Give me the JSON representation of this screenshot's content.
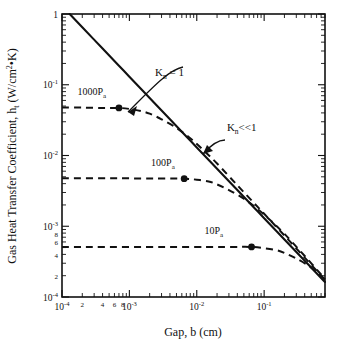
{
  "chart_data": {
    "type": "line",
    "title": "",
    "xlabel": "Gap, b (cm)",
    "ylabel": "Gas Heat Transfer Coefficient, h",
    "ylabel_sub": "t",
    "ylabel_units": " (W/cm",
    "ylabel_units_exp": "2",
    "ylabel_units_tail": "•K)",
    "xscale": "log",
    "yscale": "log",
    "xlim": [
      0.0001,
      0.8
    ],
    "ylim": [
      0.0001,
      1
    ],
    "grid": false,
    "legend": "none",
    "x_tick_labels": [
      {
        "value": 0.0001,
        "mantissa": "10",
        "exponent": "-4",
        "type": "major"
      },
      {
        "value": 0.0002,
        "mantissa": "2",
        "exponent": "",
        "type": "minor"
      },
      {
        "value": 0.0004,
        "mantissa": "4",
        "exponent": "",
        "type": "minor"
      },
      {
        "value": 0.0006,
        "mantissa": "6",
        "exponent": "",
        "type": "minor"
      },
      {
        "value": 0.0008,
        "mantissa": "8",
        "exponent": "",
        "type": "minor"
      },
      {
        "value": 0.001,
        "mantissa": "10",
        "exponent": "-3",
        "type": "major"
      },
      {
        "value": 0.01,
        "mantissa": "10",
        "exponent": "-2",
        "type": "major"
      },
      {
        "value": 0.1,
        "mantissa": "10",
        "exponent": "-1",
        "type": "major"
      }
    ],
    "y_tick_labels": [
      {
        "value": 1,
        "mantissa": "1",
        "exponent": "",
        "type": "major"
      },
      {
        "value": 0.1,
        "mantissa": "10",
        "exponent": "-1",
        "type": "major"
      },
      {
        "value": 0.01,
        "mantissa": "10",
        "exponent": "-2",
        "type": "major"
      },
      {
        "value": 0.001,
        "mantissa": "10",
        "exponent": "-3",
        "type": "major"
      },
      {
        "value": 0.0008,
        "mantissa": "8",
        "exponent": "",
        "type": "minor"
      },
      {
        "value": 0.0006,
        "mantissa": "6",
        "exponent": "",
        "type": "minor"
      },
      {
        "value": 0.0004,
        "mantissa": "4",
        "exponent": "",
        "type": "minor"
      },
      {
        "value": 0.0002,
        "mantissa": "2",
        "exponent": "",
        "type": "minor"
      },
      {
        "value": 0.0001,
        "mantissa": "10",
        "exponent": "-4",
        "type": "major"
      }
    ],
    "series": [
      {
        "name": "Kn<<1 continuum limit",
        "style": "solid",
        "points": [
          [
            0.00013,
            1.0
          ],
          [
            0.0002,
            0.65
          ],
          [
            0.0004,
            0.325
          ],
          [
            0.0007,
            0.186
          ],
          [
            0.001,
            0.13
          ],
          [
            0.002,
            0.065
          ],
          [
            0.004,
            0.0325
          ],
          [
            0.007,
            0.0186
          ],
          [
            0.01,
            0.013
          ],
          [
            0.02,
            0.0065
          ],
          [
            0.04,
            0.00325
          ],
          [
            0.07,
            0.00186
          ],
          [
            0.1,
            0.0013
          ],
          [
            0.2,
            0.00065
          ],
          [
            0.4,
            0.000325
          ],
          [
            0.7,
            0.000186
          ],
          [
            0.8,
            0.000163
          ]
        ]
      },
      {
        "name": "1000Pa",
        "style": "dashed",
        "marker_point": [
          0.0007,
          0.047
        ],
        "points": [
          [
            0.0001,
            0.0475
          ],
          [
            0.0002,
            0.0475
          ],
          [
            0.0004,
            0.047
          ],
          [
            0.0007,
            0.047
          ],
          [
            0.001,
            0.0455
          ],
          [
            0.0015,
            0.0425
          ],
          [
            0.002,
            0.039
          ],
          [
            0.003,
            0.0325
          ],
          [
            0.005,
            0.0245
          ],
          [
            0.008,
            0.0175
          ],
          [
            0.012,
            0.0124
          ],
          [
            0.02,
            0.0077
          ],
          [
            0.04,
            0.0038
          ],
          [
            0.07,
            0.00215
          ],
          [
            0.1,
            0.0015
          ],
          [
            0.2,
            0.00074
          ],
          [
            0.4,
            0.00036
          ],
          [
            0.8,
            0.000175
          ]
        ]
      },
      {
        "name": "100Pa",
        "style": "dashed",
        "marker_point": [
          0.0065,
          0.0047
        ],
        "points": [
          [
            0.0001,
            0.00475
          ],
          [
            0.001,
            0.00475
          ],
          [
            0.003,
            0.00473
          ],
          [
            0.0065,
            0.0047
          ],
          [
            0.01,
            0.00455
          ],
          [
            0.015,
            0.0043
          ],
          [
            0.02,
            0.0039
          ],
          [
            0.03,
            0.00325
          ],
          [
            0.05,
            0.00245
          ],
          [
            0.08,
            0.00175
          ],
          [
            0.12,
            0.00125
          ],
          [
            0.2,
            0.00078
          ],
          [
            0.4,
            0.00038
          ],
          [
            0.8,
            0.00018
          ]
        ]
      },
      {
        "name": "10Pa",
        "style": "dashed",
        "marker_point": [
          0.065,
          0.00051
        ],
        "points": [
          [
            0.0001,
            0.00051
          ],
          [
            0.01,
            0.00051
          ],
          [
            0.03,
            0.00051
          ],
          [
            0.065,
            0.00051
          ],
          [
            0.1,
            0.00049
          ],
          [
            0.15,
            0.00046
          ],
          [
            0.2,
            0.00042
          ],
          [
            0.3,
            0.00035
          ],
          [
            0.5,
            0.00026
          ],
          [
            0.8,
            0.000178
          ]
        ]
      }
    ],
    "series_labels": [
      {
        "text": "1000P",
        "sub": "a",
        "x": 0.00017,
        "y": 0.072
      },
      {
        "text": "100P",
        "sub": "a",
        "x": 0.0021,
        "y": 0.0072
      },
      {
        "text": "10P",
        "sub": "a",
        "x": 0.013,
        "y": 0.00078
      }
    ],
    "annotations": [
      {
        "text": "K",
        "sub": "n",
        "tail": " = 1",
        "x": 0.0024,
        "y": 0.135
      },
      {
        "text": "K",
        "sub": "n",
        "tail": "<<1",
        "x": 0.028,
        "y": 0.0225
      }
    ]
  }
}
